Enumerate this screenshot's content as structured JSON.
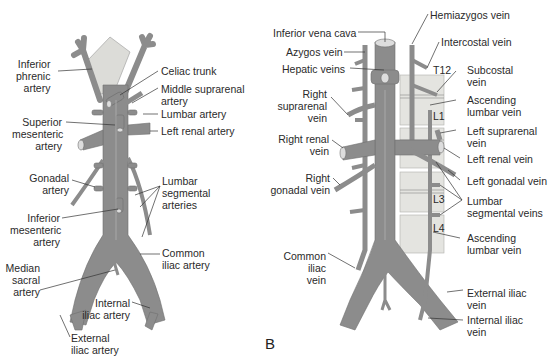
{
  "colors": {
    "vessel": "#8c8c8c",
    "vessel_edge": "#6e6e6e",
    "vertebra": "#e4e4e0",
    "leader": "#333333",
    "text": "#2a2a2a"
  },
  "panel_a": {
    "title": "Abdominal aorta and branches",
    "labels": {
      "inferior_phrenic": [
        "Inferior",
        "phrenic",
        "artery"
      ],
      "celiac_trunk": "Celiac trunk",
      "middle_suprarenal": [
        "Middle suprarenal",
        "artery"
      ],
      "lumbar_artery": "Lumbar artery",
      "superior_mesenteric": [
        "Superior",
        "mesenteric",
        "artery"
      ],
      "left_renal": "Left renal artery",
      "gonadal": [
        "Gonadal",
        "artery"
      ],
      "lumbar_segmental": [
        "Lumbar",
        "segmental",
        "arteries"
      ],
      "inferior_mesenteric": [
        "Inferior",
        "mesenteric",
        "artery"
      ],
      "common_iliac": [
        "Common",
        "iliac artery"
      ],
      "median_sacral": [
        "Median",
        "sacral",
        "artery"
      ],
      "internal_iliac": [
        "Internal",
        "iliac artery"
      ],
      "external_iliac": [
        "External",
        "iliac artery"
      ]
    }
  },
  "panel_b": {
    "letter": "B",
    "labels": {
      "ivc": "Inferior vena cava",
      "hemiazygos": "Hemiazygos vein",
      "azygos": "Azygos vein",
      "intercostal": "Intercostal vein",
      "hepatic": "Hepatic veins",
      "subcostal": [
        "Subcostal",
        "vein"
      ],
      "t12": "T12",
      "right_suprarenal": [
        "Right",
        "suprarenal",
        "vein"
      ],
      "ascending_lumbar_top": [
        "Ascending",
        "lumbar vein"
      ],
      "l1": "L1",
      "right_renal": [
        "Right renal",
        "vein"
      ],
      "left_suprarenal": [
        "Left suprarenal",
        "vein"
      ],
      "left_renal": "Left renal vein",
      "right_gonadal": [
        "Right",
        "gonadal vein"
      ],
      "left_gonadal": "Left gonadal vein",
      "l3": "L3",
      "lumbar_segmental": [
        "Lumbar",
        "segmental veins"
      ],
      "l4": "L4",
      "ascending_lumbar_bottom": [
        "Ascending",
        "lumbar vein"
      ],
      "common_iliac": [
        "Common",
        "iliac",
        "vein"
      ],
      "external_iliac": [
        "External iliac",
        "vein"
      ],
      "internal_iliac": [
        "Internal iliac",
        "vein"
      ]
    }
  }
}
